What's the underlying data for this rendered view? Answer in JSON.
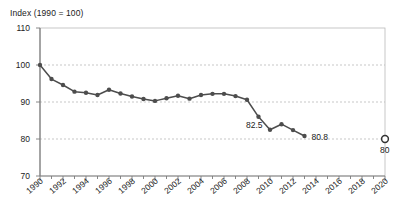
{
  "chart_data": {
    "type": "line",
    "title": "",
    "ylabel": "Index (1990 = 100)",
    "xlabel": "",
    "ylim": [
      70,
      110
    ],
    "ytick_values": [
      70,
      80,
      90,
      100,
      110
    ],
    "ytick_labels": [
      "70",
      "80",
      "90",
      "100",
      "110"
    ],
    "xlim": [
      1990,
      2020
    ],
    "xtick_values": [
      1990,
      1992,
      1994,
      1996,
      1998,
      2000,
      2002,
      2004,
      2006,
      2008,
      2010,
      2012,
      2014,
      2016,
      2018,
      2020
    ],
    "xtick_labels": [
      "1990",
      "1992",
      "1994",
      "1996",
      "1998",
      "2000",
      "2002",
      "2004",
      "2006",
      "2008",
      "2010",
      "2012",
      "2014",
      "2016",
      "2018",
      "2020"
    ],
    "grid": "horizontal-dashed",
    "legend": "none",
    "series": [
      {
        "name": "Index",
        "marker": "filled-circle",
        "color": "#4d4d4d",
        "x": [
          1990,
          1991,
          1992,
          1993,
          1994,
          1995,
          1996,
          1997,
          1998,
          1999,
          2000,
          2001,
          2002,
          2003,
          2004,
          2005,
          2006,
          2007,
          2008,
          2009,
          2010,
          2011,
          2012,
          2013
        ],
        "values": [
          100.0,
          96.2,
          94.6,
          92.8,
          92.5,
          91.9,
          93.3,
          92.3,
          91.5,
          90.8,
          90.3,
          91.0,
          91.7,
          90.9,
          91.9,
          92.2,
          92.2,
          91.6,
          90.6,
          86.0,
          82.5,
          84.0,
          82.4,
          80.8
        ]
      },
      {
        "name": "Target",
        "marker": "open-circle",
        "color": "#333333",
        "x": [
          2020
        ],
        "values": [
          80.0
        ]
      }
    ],
    "annotations": [
      {
        "text": "82.5",
        "x": 2010,
        "y": 82.5,
        "position": "left"
      },
      {
        "text": "80.8",
        "x": 2013,
        "y": 80.8,
        "position": "right"
      },
      {
        "text": "80",
        "x": 2020,
        "y": 80.0,
        "position": "below"
      }
    ]
  }
}
